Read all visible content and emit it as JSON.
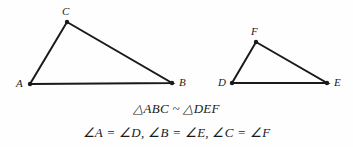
{
  "figure": {
    "background_color": "#fefefe",
    "stroke_color": "#1a1a1a",
    "stroke_width": 2,
    "vertex_dot_radius": 2.2,
    "triangles": [
      {
        "name": "triangle-abc",
        "vertices": [
          {
            "label": "A",
            "x": 30,
            "y": 84,
            "label_x": 16,
            "label_y": 78
          },
          {
            "label": "B",
            "x": 172,
            "y": 83,
            "label_x": 179,
            "label_y": 77
          },
          {
            "label": "C",
            "x": 67,
            "y": 22,
            "label_x": 62,
            "label_y": 6
          }
        ]
      },
      {
        "name": "triangle-def",
        "vertices": [
          {
            "label": "D",
            "x": 232,
            "y": 83,
            "label_x": 218,
            "label_y": 77
          },
          {
            "label": "E",
            "x": 327,
            "y": 83,
            "label_x": 334,
            "label_y": 77
          },
          {
            "label": "F",
            "x": 256,
            "y": 42,
            "label_x": 251,
            "label_y": 26
          }
        ]
      }
    ]
  },
  "captions": {
    "similarity": {
      "triangle_symbol": "△",
      "first_triangle": "ABC",
      "relation_symbol": "~",
      "second_triangle": "DEF",
      "full_text": "△ABC ~ △DEF"
    },
    "angles": {
      "angle_symbol": "∠",
      "pairs": [
        {
          "left": "∠A",
          "equals": "=",
          "right": "∠D",
          "separator": ","
        },
        {
          "left": "∠B",
          "equals": "=",
          "right": "∠E",
          "separator": ","
        },
        {
          "left": "∠C",
          "equals": "=",
          "right": "∠F",
          "separator": ""
        }
      ],
      "full_text": "∠A = ∠D,   ∠B = ∠E,   ∠C = ∠F"
    }
  }
}
